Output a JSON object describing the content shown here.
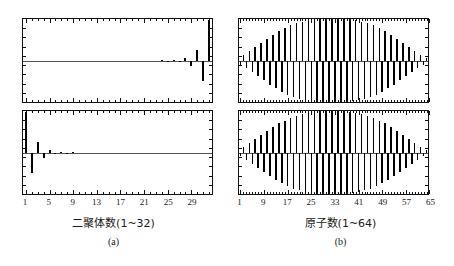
{
  "figure": {
    "background": "#ffffff",
    "bar_color": "#000000",
    "axis_color": "#111111",
    "zeroline_color": "#555555"
  },
  "panels": {
    "a": {
      "caption": "(a)",
      "xtitle": "二聚体数(1~32)",
      "xticks": [
        "1",
        "5",
        "9",
        "13",
        "17",
        "21",
        "25",
        "29"
      ],
      "xtick_values": [
        1,
        5,
        9,
        13,
        17,
        21,
        25,
        29
      ],
      "n_sites": 32
    },
    "b": {
      "caption": "(b)",
      "xtitle": "原子数(1~64)",
      "xticks": [
        "1",
        "9",
        "17",
        "25",
        "33",
        "41",
        "49",
        "57",
        "65"
      ],
      "xtick_values": [
        1,
        9,
        17,
        25,
        33,
        41,
        49,
        57,
        65
      ],
      "n_sites": 64
    }
  },
  "chart_data": [
    {
      "id": "a-top",
      "type": "bar",
      "title": "",
      "xlabel": "二聚体数(1~32)",
      "ylabel": "",
      "xlim": [
        0.5,
        32.5
      ],
      "ylim": [
        -1.0,
        1.0
      ],
      "grid": false,
      "legend": "none",
      "categories": [
        1,
        2,
        3,
        4,
        5,
        6,
        7,
        8,
        9,
        10,
        11,
        12,
        13,
        14,
        15,
        16,
        17,
        18,
        19,
        20,
        21,
        22,
        23,
        24,
        25,
        26,
        27,
        28,
        29,
        30,
        31,
        32
      ],
      "values": [
        0.0,
        0.0,
        0.0,
        0.0,
        0.0,
        0.0,
        0.0,
        0.0,
        0.0,
        0.0,
        0.0,
        0.0,
        0.0,
        0.0,
        0.0,
        0.0,
        0.0,
        0.0,
        0.0,
        0.0,
        0.0,
        0.0,
        0.0,
        0.005,
        -0.01,
        0.02,
        -0.035,
        0.07,
        -0.13,
        0.26,
        -0.5,
        0.97
      ],
      "note": "amplitudes localized at right edge, alternating sign, exponentially growing toward site 32"
    },
    {
      "id": "a-bottom",
      "type": "bar",
      "title": "",
      "xlabel": "二聚体数(1~32)",
      "ylabel": "",
      "xlim": [
        0.5,
        32.5
      ],
      "ylim": [
        -1.0,
        1.0
      ],
      "grid": false,
      "legend": "none",
      "categories": [
        1,
        2,
        3,
        4,
        5,
        6,
        7,
        8,
        9,
        10,
        11,
        12,
        13,
        14,
        15,
        16,
        17,
        18,
        19,
        20,
        21,
        22,
        23,
        24,
        25,
        26,
        27,
        28,
        29,
        30,
        31,
        32
      ],
      "values": [
        0.97,
        -0.5,
        0.26,
        -0.13,
        0.07,
        -0.035,
        0.02,
        -0.01,
        0.005,
        0.0,
        0.0,
        0.0,
        0.0,
        0.0,
        0.0,
        0.0,
        0.0,
        0.0,
        0.0,
        0.0,
        0.0,
        0.0,
        0.0,
        0.0,
        0.0,
        0.0,
        0.0,
        0.0,
        0.0,
        0.0,
        0.0,
        0.0
      ],
      "note": "mirror image: amplitudes localized at left edge, alternating sign, exponentially decaying"
    },
    {
      "id": "b-top",
      "type": "bar",
      "title": "",
      "xlabel": "原子数(1~64)",
      "ylabel": "",
      "xlim": [
        0.5,
        64.5
      ],
      "ylim": [
        -1.0,
        1.0
      ],
      "grid": false,
      "legend": "none",
      "categories": [
        1,
        2,
        3,
        4,
        5,
        6,
        7,
        8,
        9,
        10,
        11,
        12,
        13,
        14,
        15,
        16,
        17,
        18,
        19,
        20,
        21,
        22,
        23,
        24,
        25,
        26,
        27,
        28,
        29,
        30,
        31,
        32,
        33,
        34,
        35,
        36,
        37,
        38,
        39,
        40,
        41,
        42,
        43,
        44,
        45,
        46,
        47,
        48,
        49,
        50,
        51,
        52,
        53,
        54,
        55,
        56,
        57,
        58,
        59,
        60,
        61,
        62,
        63,
        64
      ],
      "values": [
        -0.1,
        0.14,
        -0.19,
        0.23,
        -0.28,
        0.33,
        -0.38,
        0.43,
        -0.48,
        0.53,
        -0.58,
        0.62,
        -0.67,
        0.71,
        -0.75,
        0.78,
        -0.82,
        0.85,
        -0.88,
        0.9,
        -0.92,
        0.94,
        -0.96,
        0.97,
        -0.98,
        0.99,
        -0.99,
        1.0,
        -1.0,
        1.0,
        -1.0,
        1.0,
        -1.0,
        1.0,
        -1.0,
        1.0,
        -0.99,
        0.99,
        -0.98,
        0.97,
        -0.96,
        0.94,
        -0.92,
        0.9,
        -0.88,
        0.85,
        -0.82,
        0.78,
        -0.75,
        0.71,
        -0.67,
        0.62,
        -0.58,
        0.53,
        -0.48,
        0.43,
        -0.38,
        0.33,
        -0.28,
        0.23,
        -0.19,
        0.14,
        -0.1,
        0.06
      ],
      "note": "extended alternating-sign state with Gaussian/sine envelope peaking near the center"
    },
    {
      "id": "b-bottom",
      "type": "bar",
      "title": "",
      "xlabel": "原子数(1~64)",
      "ylabel": "",
      "xlim": [
        0.5,
        64.5
      ],
      "ylim": [
        -1.0,
        1.0
      ],
      "grid": false,
      "legend": "none",
      "categories": [
        1,
        2,
        3,
        4,
        5,
        6,
        7,
        8,
        9,
        10,
        11,
        12,
        13,
        14,
        15,
        16,
        17,
        18,
        19,
        20,
        21,
        22,
        23,
        24,
        25,
        26,
        27,
        28,
        29,
        30,
        31,
        32,
        33,
        34,
        35,
        36,
        37,
        38,
        39,
        40,
        41,
        42,
        43,
        44,
        45,
        46,
        47,
        48,
        49,
        50,
        51,
        52,
        53,
        54,
        55,
        56,
        57,
        58,
        59,
        60,
        61,
        62,
        63,
        64
      ],
      "values": [
        -0.09,
        0.13,
        -0.18,
        0.22,
        -0.27,
        0.32,
        -0.37,
        0.42,
        -0.47,
        0.52,
        -0.57,
        0.61,
        -0.66,
        0.7,
        -0.74,
        0.77,
        -0.81,
        0.84,
        -0.87,
        0.89,
        -0.91,
        0.93,
        -0.95,
        0.96,
        -0.97,
        0.98,
        -0.99,
        0.99,
        -1.0,
        1.0,
        -1.0,
        1.0,
        -1.0,
        1.0,
        -1.0,
        0.99,
        -0.99,
        0.98,
        -0.97,
        0.96,
        -0.95,
        0.93,
        -0.91,
        0.89,
        -0.87,
        0.84,
        -0.81,
        0.77,
        -0.74,
        0.7,
        -0.66,
        0.61,
        -0.57,
        0.52,
        -0.47,
        0.42,
        -0.37,
        0.32,
        -0.27,
        0.22,
        -0.18,
        0.13,
        -0.09,
        0.05
      ],
      "note": "extended alternating-sign state with Gaussian/sine envelope, nearly identical to b-top"
    }
  ]
}
